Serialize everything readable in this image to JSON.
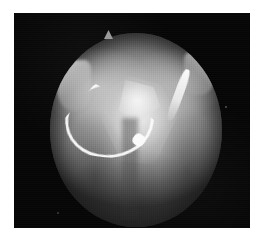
{
  "page": {
    "width": 265,
    "height": 244,
    "background_color": "#ffffff",
    "caption": ""
  },
  "image": {
    "kind": "endoscopic-fluoroscopic-grayscale-frame",
    "modality_label": "",
    "frame": {
      "x": 14,
      "y": 13,
      "width": 236,
      "height": 215,
      "background_color": "#050505"
    },
    "field_of_view": {
      "shape": "circular",
      "x": 50,
      "y": 33,
      "width": 172,
      "height": 194,
      "center_color": "#c9c9c9",
      "mid_color": "#8e8e8e",
      "edge_color": "#3a3a3a"
    },
    "features": [
      {
        "name": "bright-central-wedge",
        "description": "bright wedge-shaped tissue/bone mass near the centre of the field",
        "color": "#f0f0f0"
      },
      {
        "name": "instrument-left",
        "description": "bright curved instrument entering from the upper-left toward the centre",
        "color": "#fcfcfc"
      },
      {
        "name": "instrument-right",
        "description": "bright diagonal instrument highlight on the upper-right",
        "color": "#fcfcfc"
      },
      {
        "name": "rim-highlight-left",
        "description": "specular highlight along the upper-left rim",
        "color": "#f8f8f8"
      },
      {
        "name": "rim-highlight-right",
        "description": "specular highlight along the upper-right rim",
        "color": "#fafafa"
      },
      {
        "name": "top-spike",
        "description": "small protrusion breaking the top edge of the circular field",
        "color": "#9a9a9a"
      },
      {
        "name": "lower-tissue-shadow",
        "description": "darker, coarsely textured tissue filling the lower half of the field",
        "color": "#4a4a4a"
      },
      {
        "name": "central-sulcus",
        "description": "vertical darker groove running down from the centre",
        "color": "#464646"
      }
    ]
  }
}
